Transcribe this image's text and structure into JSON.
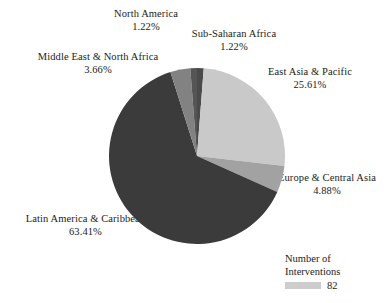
{
  "chart_data": {
    "type": "pie",
    "title": "",
    "subtitle": "",
    "xlabel": "",
    "ylabel": "",
    "grid": false,
    "legend_position": "bottom-right",
    "total_interventions": 82,
    "categories": [
      "Sub-Saharan Africa",
      "East Asia & Pacific",
      "Europe & Central Asia",
      "Latin America & Caribbean",
      "Middle East & North Africa",
      "North America"
    ],
    "values": [
      1.22,
      25.61,
      4.88,
      63.41,
      3.66,
      1.22
    ],
    "value_unit": "%",
    "colors": [
      "#4a4a4a",
      "#c9c9c9",
      "#a2a2a2",
      "#3b3b3b",
      "#828282",
      "#555555"
    ],
    "start_angle_deg": 0,
    "direction": "clockwise",
    "slices": [
      {
        "name": "Sub-Saharan Africa",
        "value": 1.22,
        "color": "#4a4a4a"
      },
      {
        "name": "East Asia & Pacific",
        "value": 25.61,
        "color": "#c9c9c9"
      },
      {
        "name": "Europe & Central Asia",
        "value": 4.88,
        "color": "#a2a2a2"
      },
      {
        "name": "Latin America & Caribbean",
        "value": 63.41,
        "color": "#3b3b3b"
      },
      {
        "name": "Middle East & North Africa",
        "value": 3.66,
        "color": "#828282"
      },
      {
        "name": "North America",
        "value": 1.22,
        "color": "#555555"
      }
    ]
  },
  "labels": {
    "north_america": {
      "name": "North America",
      "pct": "1.22%"
    },
    "sub_saharan": {
      "name": "Sub-Saharan Africa",
      "pct": "1.22%"
    },
    "mena": {
      "name": "Middle East & North Africa",
      "pct": "3.66%"
    },
    "east_asia": {
      "name": "East Asia & Pacific",
      "pct": "25.61%"
    },
    "europe": {
      "name": "Europe & Central Asia",
      "pct": "4.88%"
    },
    "latam": {
      "name": "Latin America & Caribbean",
      "pct": "63.41%"
    }
  },
  "legend": {
    "title_line1": "Number of",
    "title_line2": "Interventions",
    "value": "82",
    "swatch_color": "#cdcdcd"
  }
}
